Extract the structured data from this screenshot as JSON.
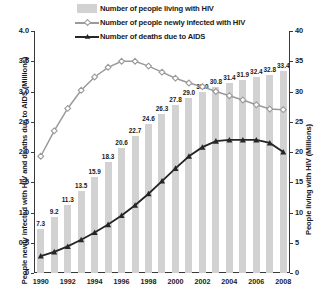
{
  "chart_data": {
    "type": "bar",
    "title": "",
    "xlabel": "",
    "ylabel": "People newly infected with HIV and deaths due to AIDS (Millions)",
    "y2label": "People living with HIV (Millions)",
    "categories": [
      1990,
      1991,
      1992,
      1993,
      1994,
      1995,
      1996,
      1997,
      1998,
      1999,
      2000,
      2001,
      2002,
      2003,
      2004,
      2005,
      2006,
      2007,
      2008
    ],
    "xtick_labels": [
      "1990",
      "1992",
      "1994",
      "1996",
      "1998",
      "2000",
      "2002",
      "2004",
      "2006",
      "2008"
    ],
    "ylim": [
      0,
      4.0
    ],
    "ytick_labels": [
      "0",
      "0.5",
      "1.0",
      "1.5",
      "2.0",
      "2.5",
      "3.0",
      "3.5",
      "4.0"
    ],
    "ytick_values": [
      0,
      0.5,
      1.0,
      1.5,
      2.0,
      2.5,
      3.0,
      3.5,
      4.0
    ],
    "y2lim": [
      0,
      40
    ],
    "y2tick_labels": [
      "0",
      "5",
      "10",
      "15",
      "20",
      "25",
      "30",
      "35",
      "40"
    ],
    "y2tick_values": [
      0,
      5,
      10,
      15,
      20,
      25,
      30,
      35,
      40
    ],
    "grid": false,
    "legend_position": "top",
    "series": [
      {
        "name": "Number of people living with HIV",
        "type": "bar",
        "axis": "right",
        "color": "#d2d2d2",
        "values": [
          7.3,
          9.2,
          11.3,
          13.5,
          15.9,
          18.3,
          20.6,
          22.7,
          24.6,
          26.3,
          27.8,
          29.0,
          30.0,
          30.8,
          31.4,
          31.9,
          32.4,
          32.8,
          33.4
        ],
        "labels": [
          "7.3",
          "9.2",
          "11.3",
          "13.5",
          "15.9",
          "18.3",
          "20.6",
          "22.7",
          "24.6",
          "26.3",
          "27.8",
          "29.0",
          "30.0",
          "30.8",
          "31.4",
          "31.9",
          "32.4",
          "32.8",
          "33.4"
        ]
      },
      {
        "name": "Number of people newly infected with HIV",
        "type": "line",
        "axis": "left",
        "color": "#9a9a9a",
        "marker": "diamond",
        "values": [
          1.93,
          2.35,
          2.72,
          3.02,
          3.24,
          3.4,
          3.5,
          3.5,
          3.42,
          3.32,
          3.22,
          3.14,
          3.08,
          3.0,
          2.93,
          2.86,
          2.78,
          2.71,
          2.7
        ]
      },
      {
        "name": "Number of deaths due to AIDS",
        "type": "line",
        "axis": "left",
        "color": "#262626",
        "marker": "triangle",
        "values": [
          0.28,
          0.35,
          0.44,
          0.55,
          0.67,
          0.8,
          0.95,
          1.12,
          1.31,
          1.52,
          1.73,
          1.93,
          2.08,
          2.18,
          2.2,
          2.2,
          2.2,
          2.15,
          2.0
        ]
      }
    ]
  },
  "legend": {
    "items": [
      {
        "label": "Number of people living with HIV",
        "key": "swatch"
      },
      {
        "label": "Number of people newly infected with HIV",
        "key": "line-diamond"
      },
      {
        "label": "Number of deaths due to AIDS",
        "key": "line-triangle"
      }
    ]
  },
  "axes": {
    "left_title": "People newly infected with HIV and deaths due to AIDS (Millions)",
    "right_title": "People living with HIV (Millions)"
  }
}
